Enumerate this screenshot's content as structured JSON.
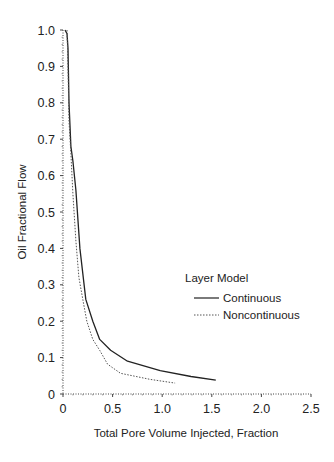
{
  "chart_data": {
    "type": "line",
    "title": "",
    "xlabel": "Total Pore Volume Injected, Fraction",
    "ylabel": "Oil Fractional Flow",
    "xlim": [
      0,
      2.5
    ],
    "ylim": [
      0,
      1.0
    ],
    "xticks": [
      "0",
      "0.5",
      "1.0",
      "1.5",
      "2.0",
      "2.5"
    ],
    "yticks": [
      "0",
      "0.1",
      "0.2",
      "0.3",
      "0.4",
      "0.5",
      "0.6",
      "0.7",
      "0.8",
      "0.9",
      "1.0"
    ],
    "grid": false,
    "legend": {
      "title": "Layer Model",
      "position": "right-middle",
      "entries": [
        "Continuous",
        "Noncontinuous"
      ]
    },
    "series": [
      {
        "name": "Continuous",
        "style": "solid",
        "color": "#222222",
        "x": [
          0.02,
          0.04,
          0.05,
          0.06,
          0.08,
          0.1,
          0.13,
          0.17,
          0.23,
          0.3,
          0.37,
          0.48,
          0.65,
          0.98,
          1.29,
          1.54
        ],
        "y": [
          1.0,
          0.99,
          0.95,
          0.8,
          0.68,
          0.64,
          0.56,
          0.4,
          0.26,
          0.2,
          0.15,
          0.12,
          0.09,
          0.064,
          0.048,
          0.038
        ]
      },
      {
        "name": "Noncontinuous",
        "style": "dotted",
        "color": "#555555",
        "x": [
          0.04,
          0.05,
          0.06,
          0.08,
          0.1,
          0.13,
          0.16,
          0.2,
          0.24,
          0.3,
          0.37,
          0.45,
          0.58,
          0.88,
          1.13
        ],
        "y": [
          1.0,
          0.9,
          0.75,
          0.66,
          0.55,
          0.42,
          0.32,
          0.26,
          0.2,
          0.15,
          0.12,
          0.082,
          0.057,
          0.04,
          0.03
        ]
      }
    ]
  }
}
